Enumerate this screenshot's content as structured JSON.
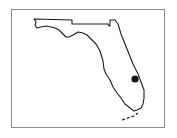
{
  "map": {
    "region": "Florida",
    "outline_color": "#1a1a1a",
    "frame_color": "#8a8a8a",
    "marker": {
      "shape": "dot",
      "color": "#111111",
      "location_hint": "southeast Florida, inland of the Atlantic coast"
    }
  }
}
